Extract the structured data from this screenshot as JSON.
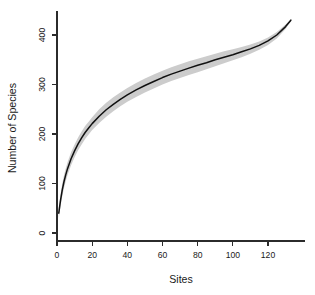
{
  "chart_data": {
    "type": "line",
    "title": "",
    "subtitle": "",
    "xlabel": "Sites",
    "ylabel": "Number of Species",
    "xlim": [
      0,
      137
    ],
    "ylim": [
      0,
      440
    ],
    "grid": false,
    "legend": null,
    "legend_position": "none",
    "xticks": [
      0,
      20,
      40,
      60,
      80,
      100,
      120
    ],
    "xtick_labels": [
      "0",
      "20",
      "40",
      "60",
      "80",
      "100",
      "120"
    ],
    "yticks": [
      0,
      100,
      200,
      300,
      400
    ],
    "ytick_labels": [
      "0",
      "100",
      "200",
      "300",
      "400"
    ],
    "annotations": [],
    "colors": {
      "line": "#111111",
      "band": "#cccccc",
      "axis": "#2b2b2b",
      "background": "#ffffff",
      "text": "#1a1a1a"
    },
    "series": [
      {
        "name": "Mean richness",
        "x": [
          1,
          2,
          3,
          4,
          5,
          6,
          8,
          10,
          12,
          14,
          16,
          18,
          20,
          24,
          28,
          32,
          36,
          40,
          45,
          50,
          55,
          60,
          65,
          70,
          75,
          80,
          85,
          90,
          95,
          100,
          105,
          110,
          115,
          120,
          125,
          130,
          133
        ],
        "values": [
          40,
          66,
          87,
          104,
          118,
          130,
          150,
          166,
          180,
          192,
          203,
          212,
          221,
          236,
          249,
          260,
          270,
          279,
          289,
          298,
          306,
          314,
          321,
          327,
          333,
          339,
          344,
          350,
          355,
          360,
          366,
          372,
          379,
          388,
          400,
          417,
          430
        ]
      },
      {
        "name": "Upper bound (+SD)",
        "x": [
          1,
          2,
          3,
          4,
          5,
          6,
          8,
          10,
          12,
          14,
          16,
          18,
          20,
          24,
          28,
          32,
          36,
          40,
          45,
          50,
          55,
          60,
          65,
          70,
          75,
          80,
          85,
          90,
          95,
          100,
          105,
          110,
          115,
          120,
          125,
          130,
          133
        ],
        "values": [
          50,
          78,
          100,
          117,
          131,
          143,
          163,
          179,
          193,
          205,
          216,
          225,
          234,
          250,
          263,
          274,
          284,
          293,
          303,
          312,
          320,
          328,
          335,
          341,
          347,
          352,
          357,
          362,
          367,
          371,
          376,
          381,
          387,
          395,
          406,
          421,
          432
        ]
      },
      {
        "name": "Lower bound (-SD)",
        "x": [
          1,
          2,
          3,
          4,
          5,
          6,
          8,
          10,
          12,
          14,
          16,
          18,
          20,
          24,
          28,
          32,
          36,
          40,
          45,
          50,
          55,
          60,
          65,
          70,
          75,
          80,
          85,
          90,
          95,
          100,
          105,
          110,
          115,
          120,
          125,
          130,
          133
        ],
        "values": [
          30,
          54,
          74,
          91,
          105,
          117,
          137,
          153,
          167,
          179,
          190,
          199,
          208,
          222,
          235,
          246,
          256,
          265,
          275,
          284,
          292,
          300,
          307,
          313,
          319,
          325,
          331,
          337,
          343,
          349,
          355,
          362,
          370,
          380,
          393,
          412,
          428
        ]
      }
    ]
  },
  "axis_titles": {
    "x": "Sites",
    "y": "Number of Species"
  }
}
